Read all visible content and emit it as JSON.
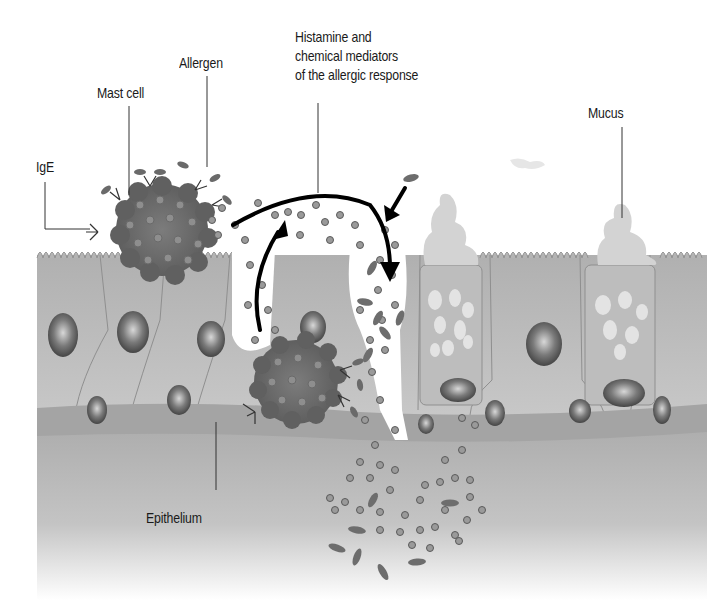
{
  "diagram": {
    "labels": {
      "ige": "IgE",
      "mast_cell": "Mast cell",
      "allergen": "Allergen",
      "histamine_line1": "Histamine and",
      "histamine_line2": "chemical mediators",
      "histamine_line3": "of the allergic response",
      "mucus": "Mucus",
      "epithelium": "Epithelium"
    },
    "colors": {
      "background": "#ffffff",
      "tissue": "#b9b9b9",
      "tissue_dark": "#9a9a9a",
      "basement": "#a8a8a8",
      "mast_cell": "#6d6d6d",
      "granule": "#8a8a8a",
      "nucleus": "#5e5e5e",
      "mucus": "#d0d0d0",
      "arrow": "#000000",
      "text": "#1a1a1a"
    }
  }
}
